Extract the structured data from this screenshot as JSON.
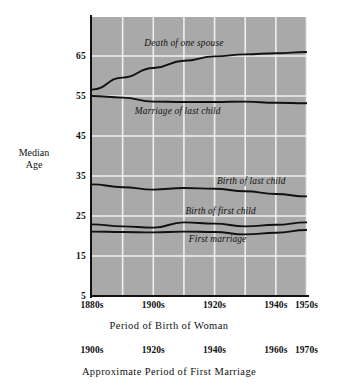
{
  "chart_data": {
    "type": "line",
    "title": "",
    "xlabel": "Period of Birth of Woman",
    "xlabel_secondary": "Approximate Period of First Marriage",
    "ylabel": "Median Age",
    "ylabel_line1": "Median",
    "ylabel_line2": "Age",
    "ylim": [
      5,
      74.75
    ],
    "yticks": [
      65,
      55,
      45,
      35,
      25,
      15,
      5
    ],
    "ytick_labels": [
      "65",
      "55",
      "45",
      "35",
      "25",
      "15",
      "5"
    ],
    "grid": true,
    "grid_color": "#f0f0f0",
    "plot_background": "#a9a9a9",
    "line_color": "#111111",
    "legend": "inline-labels",
    "x": [
      "1880s",
      "1890s",
      "1900s",
      "1910s",
      "1920s",
      "1930s",
      "1940s",
      "1950s"
    ],
    "xticks_shown": [
      "1880s",
      "1900s",
      "1920s",
      "1940s",
      "1950s"
    ],
    "xticks_secondary_shown": [
      "1900s",
      "1920s",
      "1940s",
      "1960s",
      "1970s"
    ],
    "series": [
      {
        "name": "Death of one spouse",
        "values": [
          56.6,
          59.6,
          62.0,
          63.8,
          64.9,
          65.4,
          65.7,
          66.0
        ]
      },
      {
        "name": "Marriage of last child",
        "values": [
          55.0,
          54.6,
          53.6,
          53.5,
          53.5,
          53.6,
          53.3,
          53.2
        ]
      },
      {
        "name": "Birth of last child",
        "values": [
          32.9,
          32.2,
          31.6,
          32.0,
          31.8,
          31.2,
          30.5,
          29.9
        ]
      },
      {
        "name": "Birth of first child",
        "values": [
          22.9,
          22.4,
          22.1,
          23.4,
          23.1,
          22.4,
          22.8,
          23.4
        ]
      },
      {
        "name": "First marriage",
        "values": [
          21.1,
          21.0,
          20.9,
          21.1,
          21.0,
          20.4,
          20.8,
          21.5
        ]
      }
    ],
    "annotations": [
      {
        "text": "Death of one spouse",
        "x": 1910,
        "y": 67.5
      },
      {
        "text": "Marriage of last child",
        "x": 1908,
        "y": 50.5
      },
      {
        "text": "Birth of last child",
        "x": 1932,
        "y": 33.0
      },
      {
        "text": "Birth of first child",
        "x": 1922,
        "y": 25.5
      },
      {
        "text": "First marriage",
        "x": 1921,
        "y": 18.5
      }
    ]
  },
  "axes": {
    "y_ticks": [
      {
        "label": "65",
        "value": 65
      },
      {
        "label": "55",
        "value": 55
      },
      {
        "label": "45",
        "value": 45
      },
      {
        "label": "35",
        "value": 35
      },
      {
        "label": "25",
        "value": 25
      },
      {
        "label": "15",
        "value": 15
      },
      {
        "label": "5",
        "value": 5
      }
    ],
    "y_title_line1": "Median",
    "y_title_line2": "Age",
    "x_primary_ticks": [
      {
        "label": "1880s",
        "pos": 0
      },
      {
        "label": "1900s",
        "pos": 2
      },
      {
        "label": "1920s",
        "pos": 4
      },
      {
        "label": "1940s",
        "pos": 6
      },
      {
        "label": "1950s",
        "pos": 7
      }
    ],
    "x_primary_title": "Period of Birth of Woman",
    "x_secondary_ticks": [
      {
        "label": "1900s",
        "pos": 0
      },
      {
        "label": "1920s",
        "pos": 2
      },
      {
        "label": "1940s",
        "pos": 4
      },
      {
        "label": "1960s",
        "pos": 6
      },
      {
        "label": "1970s",
        "pos": 7
      }
    ],
    "x_secondary_title": "Approximate Period of First Marriage"
  }
}
